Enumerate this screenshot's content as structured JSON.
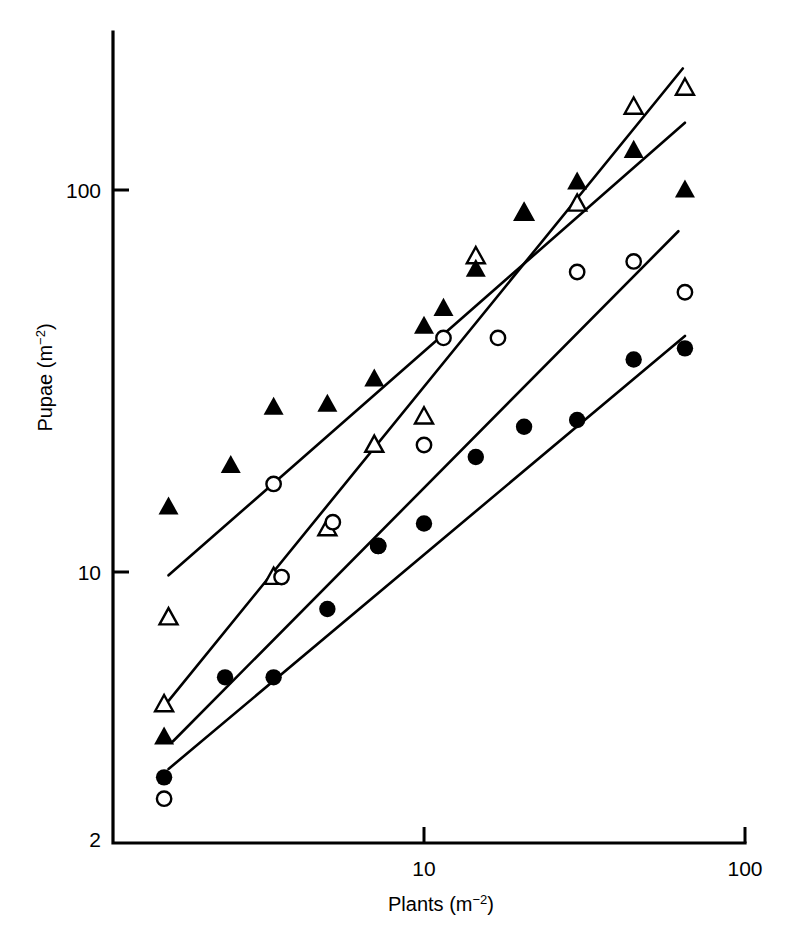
{
  "figure": {
    "background": "#ffffff",
    "ink_color": "#000000"
  },
  "chart_data": {
    "type": "scatter",
    "title": "",
    "subtitle": "",
    "xlabel": "Plants (m⁻²)",
    "ylabel": "Pupae (m⁻²)",
    "xscale": "log",
    "yscale": "log",
    "xlim": [
      1.1,
      100
    ],
    "ylim": [
      2,
      232
    ],
    "grid": false,
    "legend_position": "none",
    "xticks": [
      10,
      100
    ],
    "xtick_labels": [
      "10",
      "100"
    ],
    "yticks": [
      2,
      10,
      100
    ],
    "ytick_labels": [
      "2",
      "10",
      "100"
    ],
    "annotations": [],
    "series": [
      {
        "name": "open-triangle",
        "marker": "triangle-open",
        "marker_filled": false,
        "points": [
          {
            "x": 1.55,
            "y": 4.5
          },
          {
            "x": 1.6,
            "y": 7.6
          },
          {
            "x": 3.4,
            "y": 9.7
          },
          {
            "x": 5.0,
            "y": 13.0
          },
          {
            "x": 7.0,
            "y": 21.5
          },
          {
            "x": 10.0,
            "y": 25.5
          },
          {
            "x": 14.5,
            "y": 67.0
          },
          {
            "x": 20.5,
            "y": 87.0
          },
          {
            "x": 30.0,
            "y": 92.0
          },
          {
            "x": 45.0,
            "y": 165.0
          },
          {
            "x": 65.0,
            "y": 185.0
          }
        ],
        "fit_line": {
          "x1": 1.6,
          "y1": 4.6,
          "x2": 64.0,
          "y2": 208.0
        }
      },
      {
        "name": "filled-triangle",
        "marker": "triangle-filled",
        "marker_filled": true,
        "points": [
          {
            "x": 1.55,
            "y": 3.7
          },
          {
            "x": 1.6,
            "y": 14.8
          },
          {
            "x": 2.5,
            "y": 19.0
          },
          {
            "x": 3.4,
            "y": 27.0
          },
          {
            "x": 5.0,
            "y": 27.5
          },
          {
            "x": 7.0,
            "y": 32.0
          },
          {
            "x": 10.0,
            "y": 44.0
          },
          {
            "x": 11.5,
            "y": 49.0
          },
          {
            "x": 14.5,
            "y": 62.0
          },
          {
            "x": 20.5,
            "y": 87.0
          },
          {
            "x": 30.0,
            "y": 105.0
          },
          {
            "x": 45.0,
            "y": 127.0
          },
          {
            "x": 65.0,
            "y": 100.0
          }
        ],
        "fit_line": {
          "x1": 1.6,
          "y1": 9.8,
          "x2": 65.0,
          "y2": 150.0
        }
      },
      {
        "name": "open-circle",
        "marker": "circle-open",
        "marker_filled": false,
        "points": [
          {
            "x": 1.55,
            "y": 2.55
          },
          {
            "x": 3.4,
            "y": 17.0
          },
          {
            "x": 3.6,
            "y": 9.7
          },
          {
            "x": 5.2,
            "y": 13.5
          },
          {
            "x": 7.2,
            "y": 11.7
          },
          {
            "x": 10.0,
            "y": 21.5
          },
          {
            "x": 11.5,
            "y": 41.0
          },
          {
            "x": 17.0,
            "y": 41.0
          },
          {
            "x": 30.0,
            "y": 61.0
          },
          {
            "x": 45.0,
            "y": 65.0
          },
          {
            "x": 65.0,
            "y": 54.0
          }
        ],
        "fit_line": {
          "x1": 1.65,
          "y1": 3.6,
          "x2": 62.0,
          "y2": 78.0
        }
      },
      {
        "name": "filled-circle",
        "marker": "circle-filled",
        "marker_filled": true,
        "points": [
          {
            "x": 1.55,
            "y": 2.9
          },
          {
            "x": 2.4,
            "y": 5.3
          },
          {
            "x": 3.4,
            "y": 5.3
          },
          {
            "x": 5.0,
            "y": 8.0
          },
          {
            "x": 7.2,
            "y": 11.7
          },
          {
            "x": 10.0,
            "y": 13.4
          },
          {
            "x": 14.5,
            "y": 20.0
          },
          {
            "x": 20.5,
            "y": 24.0
          },
          {
            "x": 30.0,
            "y": 25.0
          },
          {
            "x": 45.0,
            "y": 36.0
          },
          {
            "x": 65.0,
            "y": 38.5
          }
        ],
        "fit_line": {
          "x1": 1.6,
          "y1": 3.05,
          "x2": 65.0,
          "y2": 41.5
        }
      }
    ]
  }
}
